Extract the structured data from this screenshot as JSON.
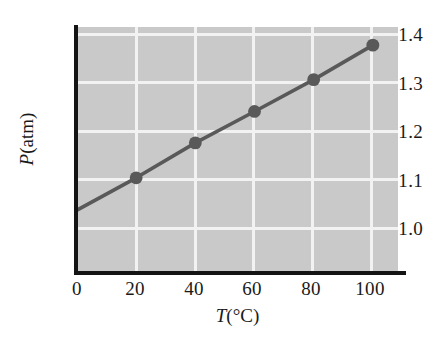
{
  "chart_data": {
    "type": "line",
    "title": "",
    "subtitle": "",
    "xlabel": "T(°C)",
    "xlabel_symbol": "T",
    "xlabel_unit": "(°C)",
    "ylabel": "P(atm)",
    "ylabel_symbol": "P",
    "ylabel_unit": "(atm)",
    "x": [
      0,
      20,
      40,
      60,
      80,
      100
    ],
    "values": [
      1.0,
      1.073,
      1.152,
      1.223,
      1.295,
      1.373
    ],
    "markers_x": [
      20,
      40,
      60,
      80,
      100
    ],
    "markers_y": [
      1.073,
      1.152,
      1.223,
      1.295,
      1.373
    ],
    "xlim": [
      0,
      108.5
    ],
    "ylim": [
      0.86,
      1.414
    ],
    "xticks": [
      0,
      20,
      40,
      60,
      80,
      100
    ],
    "xtick_labels": [
      "0",
      "20",
      "40",
      "60",
      "80",
      "100"
    ],
    "yticks": [
      1.0,
      1.1,
      1.2,
      1.3,
      1.4
    ],
    "ytick_labels": [
      "1.0",
      "1.1",
      "1.2",
      "1.3",
      "1.4"
    ],
    "grid": true,
    "grid_color": "#f2f2f2",
    "legend": null,
    "legend_position": "none",
    "series": [
      {
        "name": "pressure-vs-temperature",
        "x": [
          0,
          20,
          40,
          60,
          80,
          100
        ],
        "values": [
          1.0,
          1.073,
          1.152,
          1.223,
          1.295,
          1.373
        ]
      }
    ]
  },
  "style": {
    "plot_background": "#c9c9c9",
    "page_background": "#ffffff",
    "line_color": "#595959",
    "marker_color": "#595959",
    "axis_color": "#141414",
    "tick_text_color": "#1a1a1a"
  }
}
